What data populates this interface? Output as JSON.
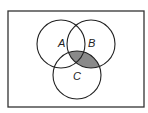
{
  "diagram": {
    "type": "venn",
    "universe": {
      "x": 8,
      "y": 11,
      "width": 136,
      "height": 96
    },
    "sets": [
      {
        "name": "A",
        "label": "A",
        "cx": 61,
        "cy": 44,
        "r": 24
      },
      {
        "name": "B",
        "label": "B",
        "cx": 91,
        "cy": 44,
        "r": 24
      },
      {
        "name": "C",
        "label": "C",
        "cx": 77,
        "cy": 75,
        "r": 24
      }
    ],
    "shaded_region": "B ∩ C",
    "colors": {
      "stroke": "#222222",
      "shade": "#8a8a8a",
      "background": "#ffffff"
    }
  }
}
